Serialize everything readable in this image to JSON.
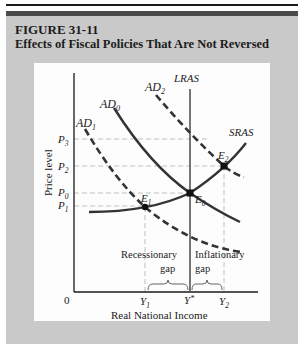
{
  "figure": {
    "number": "FIGURE 31-11",
    "title": "Effects of Fiscal Policies That Are Not Reversed"
  },
  "axes": {
    "ylabel": "Price level",
    "xlabel": "Real National Income",
    "origin": "0"
  },
  "price_levels": [
    {
      "id": "P3",
      "base": "P",
      "sub": "3"
    },
    {
      "id": "P2",
      "base": "P",
      "sub": "2"
    },
    {
      "id": "P0",
      "base": "P",
      "sub": "0"
    },
    {
      "id": "P1",
      "base": "P",
      "sub": "1"
    }
  ],
  "income_levels": [
    {
      "id": "Y1",
      "base": "Y",
      "sub": "1"
    },
    {
      "id": "Ystar",
      "base": "Y",
      "sup": "*"
    },
    {
      "id": "Y2",
      "base": "Y",
      "sub": "2"
    }
  ],
  "curves": {
    "lras": "LRAS",
    "sras": "SRAS",
    "ad0": {
      "base": "AD",
      "sub": "0"
    },
    "ad1": {
      "base": "AD",
      "sub": "1"
    },
    "ad2": {
      "base": "AD",
      "sub": "2"
    }
  },
  "equilibria": {
    "e0": {
      "base": "E",
      "sub": "0"
    },
    "e1": {
      "base": "E",
      "sub": "1"
    },
    "e2": {
      "base": "E",
      "sub": "2"
    }
  },
  "gaps": {
    "recessionary_1": "Recessionary",
    "recessionary_2": "gap",
    "inflationary_1": "Inflationary",
    "inflationary_2": "gap"
  },
  "colors": {
    "curve": "#333333",
    "guide": "#aaaaaa",
    "background_gray": "#c9c9c9",
    "band": "#4a4a4a"
  }
}
